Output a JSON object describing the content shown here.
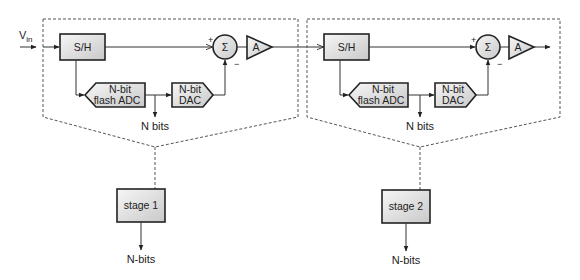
{
  "diagram": {
    "type": "pipelined ADC block diagram",
    "input_label": "V",
    "input_subscript": "in",
    "stages": [
      {
        "id": "stage1",
        "sample_hold_label": "S/H",
        "adc_label_line1": "N-bit",
        "adc_label_line2": "flash ADC",
        "dac_label_line1": "N-bit",
        "dac_label_line2": "DAC",
        "summer_symbol": "Σ",
        "summer_plus": "+",
        "summer_minus": "−",
        "amp_label": "A",
        "bits_output_label": "N bits",
        "stage_box_label": "stage 1",
        "stage_output_label": "N-bits"
      },
      {
        "id": "stage2",
        "sample_hold_label": "S/H",
        "adc_label_line1": "N-bit",
        "adc_label_line2": "flash ADC",
        "dac_label_line1": "N-bit",
        "dac_label_line2": "DAC",
        "summer_symbol": "Σ",
        "summer_plus": "+",
        "summer_minus": "−",
        "amp_label": "A",
        "bits_output_label": "N bits",
        "stage_box_label": "stage 2",
        "stage_output_label": "N-bits"
      }
    ],
    "colors": {
      "block_fill_light": "#f4f4f4",
      "block_fill_dark": "#c8c8c8",
      "stroke": "#222222",
      "dashed": "#555555"
    }
  }
}
